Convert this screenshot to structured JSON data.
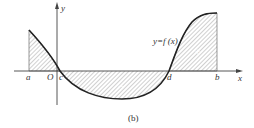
{
  "figure": {
    "caption": "(b)",
    "function_label": "y=f (x)",
    "axes": {
      "x_label": "x",
      "y_label": "y",
      "origin_label": "O"
    },
    "points": {
      "a": "a",
      "c": "c",
      "d": "d",
      "b": "b"
    },
    "regions": [
      {
        "name": "left-positive",
        "sign": "+"
      },
      {
        "name": "middle-negative",
        "sign": "−"
      },
      {
        "name": "right-positive",
        "sign": "+"
      }
    ],
    "colors": {
      "curve": "#222222",
      "hatch": "#888888",
      "axis": "#444444"
    }
  }
}
